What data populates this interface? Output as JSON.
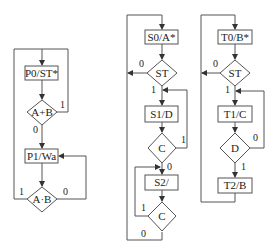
{
  "diagrams": {
    "left": {
      "states": [
        "P0/ST*",
        "P1/Wa"
      ],
      "decisions": [
        "A+B",
        "A·B"
      ],
      "labels": {
        "d1_true": "1",
        "d1_false": "0",
        "d2_true": "1",
        "d2_false": "0"
      }
    },
    "middle": {
      "states": [
        "S0/A*",
        "S1/D",
        "S2/"
      ],
      "decisions": [
        "ST",
        "C",
        "C"
      ],
      "labels": {
        "st_false": "0",
        "st_true": "1",
        "c1_true": "1",
        "c1_false": "0",
        "c2_true": "1",
        "c2_false": "0"
      }
    },
    "right": {
      "states": [
        "T0/B*",
        "T1/C",
        "T2/B"
      ],
      "decisions": [
        "ST",
        "D"
      ],
      "labels": {
        "st_false": "0",
        "st_true": "1",
        "d_false": "0",
        "d_true": "1"
      }
    }
  },
  "colors": {
    "line": "#555555",
    "text": "#222222",
    "background": "#ffffff"
  }
}
